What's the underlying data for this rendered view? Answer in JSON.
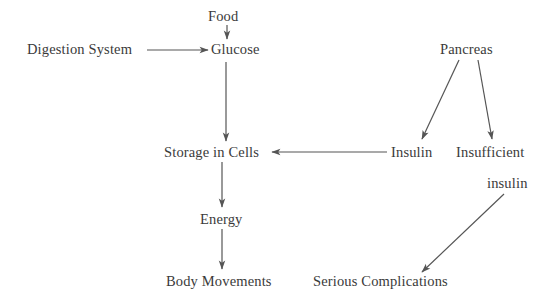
{
  "diagram": {
    "type": "flowchart",
    "canvas": {
      "width": 554,
      "height": 304
    },
    "background_color": "#ffffff",
    "text_color": "#3a3a3a",
    "edge_color": "#555555",
    "nodes": [
      {
        "id": "food",
        "label": "Food",
        "x": 208,
        "y": 9
      },
      {
        "id": "digestion_system",
        "label": "Digestion System",
        "x": 27,
        "y": 42
      },
      {
        "id": "glucose",
        "label": "Glucose",
        "x": 211,
        "y": 42
      },
      {
        "id": "pancreas",
        "label": "Pancreas",
        "x": 440,
        "y": 42
      },
      {
        "id": "storage_in_cells",
        "label": "Storage in Cells",
        "x": 164,
        "y": 145
      },
      {
        "id": "insulin",
        "label": "Insulin",
        "x": 391,
        "y": 145
      },
      {
        "id": "insufficient",
        "label": "Insufficient",
        "x": 456,
        "y": 145
      },
      {
        "id": "insufficient_insulin_second_line",
        "label": "insulin",
        "x": 487,
        "y": 176
      },
      {
        "id": "energy",
        "label": "Energy",
        "x": 200,
        "y": 212
      },
      {
        "id": "body_movements",
        "label": "Body Movements",
        "x": 166,
        "y": 274
      },
      {
        "id": "serious_complications",
        "label": "Serious Complications",
        "x": 313,
        "y": 274
      }
    ],
    "edges": [
      {
        "id": "food-to-glucose",
        "from": "food",
        "to": "glucose",
        "x1": 227,
        "y1": 25,
        "x2": 227,
        "y2": 39
      },
      {
        "id": "digestion-to-glucose",
        "from": "digestion_system",
        "to": "glucose",
        "x1": 147,
        "y1": 50,
        "x2": 208,
        "y2": 50
      },
      {
        "id": "glucose-to-storage",
        "from": "glucose",
        "to": "storage_in_cells",
        "x1": 226,
        "y1": 62,
        "x2": 226,
        "y2": 141
      },
      {
        "id": "pancreas-to-insulin",
        "from": "pancreas",
        "to": "insulin",
        "x1": 459,
        "y1": 60,
        "x2": 422,
        "y2": 139
      },
      {
        "id": "pancreas-to-insufficient",
        "from": "pancreas",
        "to": "insufficient",
        "x1": 478,
        "y1": 60,
        "x2": 492,
        "y2": 139
      },
      {
        "id": "insulin-to-storage",
        "from": "insulin",
        "to": "storage_in_cells",
        "x1": 387,
        "y1": 152,
        "x2": 272,
        "y2": 152
      },
      {
        "id": "storage-to-energy",
        "from": "storage_in_cells",
        "to": "energy",
        "x1": 222,
        "y1": 162,
        "x2": 222,
        "y2": 207
      },
      {
        "id": "energy-to-body-movements",
        "from": "energy",
        "to": "body_movements",
        "x1": 222,
        "y1": 229,
        "x2": 222,
        "y2": 269
      },
      {
        "id": "insufficient-insulin-to-complications",
        "from": "insufficient_insulin_second_line",
        "to": "serious_complications",
        "x1": 504,
        "y1": 194,
        "x2": 422,
        "y2": 272
      }
    ]
  }
}
